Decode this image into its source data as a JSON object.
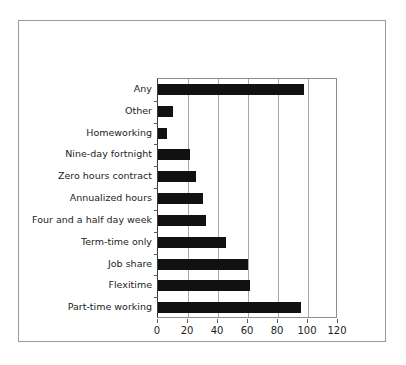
{
  "figure": {
    "background_color": "#ffffff",
    "frame_color": "#9a9a9a",
    "bar_color": "#111111",
    "grid_color": "#a8a8a8",
    "axis_color": "#5a5a5a"
  },
  "chart_data": {
    "type": "bar",
    "orientation": "horizontal",
    "title": "",
    "subtitle": "",
    "xlabel": "",
    "ylabel": "",
    "xlim": [
      0,
      120
    ],
    "xticks": [
      0,
      20,
      40,
      60,
      80,
      100,
      120
    ],
    "xtick_labels": [
      "0",
      "20",
      "40",
      "60",
      "80",
      "100",
      "120"
    ],
    "grid": true,
    "grid_axis": "x",
    "legend": false,
    "legend_position": "none",
    "categories": [
      "Any",
      "Other",
      "Homeworking",
      "Nine-day fortnight",
      "Zero hours contract",
      "Annualized hours",
      "Four and a half day week",
      "Term-time only",
      "Job share",
      "Flexitime",
      "Part-time working"
    ],
    "values": [
      97,
      10,
      6,
      21,
      25,
      30,
      32,
      45,
      60,
      61,
      95
    ],
    "series": [
      {
        "name": "",
        "color": "#111111",
        "values": [
          97,
          10,
          6,
          21,
          25,
          30,
          32,
          45,
          60,
          61,
          95
        ]
      }
    ]
  }
}
